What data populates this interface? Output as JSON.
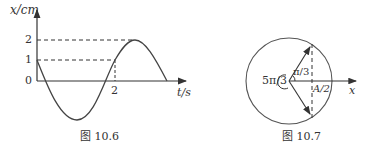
{
  "figure_left": {
    "caption": "图 10.6",
    "y_axis_label": "x/cm",
    "x_axis_label": "t/s",
    "y_ticks": [
      "2",
      "1",
      "0"
    ],
    "x_ticks": [
      "2"
    ],
    "curve": "x = 2cos(ωt + π/3), starts at x=1 decreasing, min -2, passes x=1 rising at t=2, max 2"
  },
  "figure_right": {
    "caption": "图 10.7",
    "angle_small": "π/3",
    "angle_large": "5π/3",
    "projection_label": "A/2",
    "axis_label": "x"
  }
}
